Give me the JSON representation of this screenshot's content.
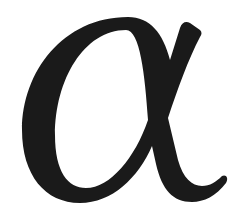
{
  "glyph": {
    "character": "α",
    "name": "Greek small letter alpha",
    "color": "#1a1a1a",
    "background": "#ffffff"
  }
}
